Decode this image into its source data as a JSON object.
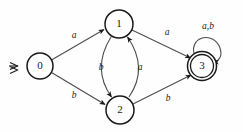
{
  "figure": {
    "kind": "finite-state-automaton",
    "background_color": "#fefefe",
    "node_stroke_color": "#1a1a1a",
    "edge_stroke_color": "#4d4d4d",
    "label_color": "#1a1a1a"
  },
  "states": [
    {
      "id": "0",
      "label": "0",
      "cx": 40,
      "cy": 66,
      "r": 13,
      "accepting": false,
      "start": true
    },
    {
      "id": "1",
      "label": "1",
      "cx": 119,
      "cy": 24,
      "r": 14,
      "accepting": false,
      "start": false
    },
    {
      "id": "2",
      "label": "2",
      "cx": 120,
      "cy": 110,
      "r": 14,
      "accepting": false,
      "start": false
    },
    {
      "id": "3",
      "label": "3",
      "cx": 202,
      "cy": 66,
      "r": 14.5,
      "r_inner": 11.5,
      "accepting": true,
      "start": false
    }
  ],
  "start_marker": {
    "symbol": "double-arrow",
    "x": 16,
    "y": 66
  },
  "transitions": [
    {
      "id": "t0",
      "from": "0",
      "to": "1",
      "symbol": "a",
      "label_x": 74,
      "label_y": 36
    },
    {
      "id": "t1",
      "from": "0",
      "to": "2",
      "symbol": "b",
      "label_x": 74,
      "label_y": 96
    },
    {
      "id": "t2",
      "from": "1",
      "to": "2",
      "symbol": "b",
      "label_x": 101,
      "label_y": 68
    },
    {
      "id": "t3",
      "from": "2",
      "to": "1",
      "symbol": "a",
      "label_x": 140,
      "label_y": 68
    },
    {
      "id": "t4",
      "from": "1",
      "to": "3",
      "symbol": "a",
      "label_x": 167,
      "label_y": 33
    },
    {
      "id": "t5",
      "from": "2",
      "to": "3",
      "symbol": "b",
      "label_x": 168,
      "label_y": 99
    },
    {
      "id": "t6",
      "from": "3",
      "to": "3",
      "symbol": "a,b",
      "label_x": 208,
      "label_y": 27,
      "self_loop": true
    }
  ]
}
